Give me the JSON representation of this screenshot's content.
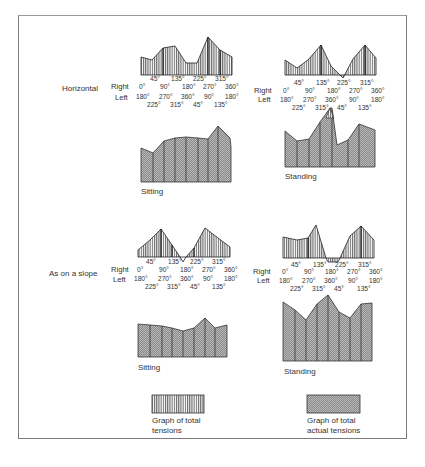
{
  "figure": {
    "rows": [
      {
        "label": "Horizontal",
        "panels": [
          {
            "name": "sitting",
            "caption": "Sitting",
            "right_label": "Right",
            "left_label": "Left",
            "top_ticks": [
              "45°",
              "135°",
              "225°",
              "315°"
            ],
            "right_ticks": [
              "0°",
              "90°",
              "180°",
              "270°",
              "360°"
            ],
            "left_ticks": [
              "180°",
              "270°",
              "360°",
              "90°",
              "180°"
            ],
            "bottom_ticks": [
              "225°",
              "315°",
              "45°",
              "135°"
            ]
          },
          {
            "name": "standing",
            "caption": "Standing",
            "right_label": "Right",
            "left_label": "Left",
            "top_ticks": [
              "45°",
              "135°",
              "225°",
              "315°"
            ],
            "right_ticks": [
              "0°",
              "90°",
              "180°",
              "270°",
              "360°"
            ],
            "left_ticks": [
              "180°",
              "270°",
              "360°",
              "90°",
              "180°"
            ],
            "bottom_ticks": [
              "225°",
              "315°",
              "45°",
              "135°"
            ]
          }
        ]
      },
      {
        "label": "As on a slope",
        "panels": [
          {
            "name": "sitting",
            "caption": "Sitting",
            "right_label": "Right",
            "left_label": "Left",
            "top_ticks": [
              "45°",
              "135°",
              "225°",
              "315°"
            ],
            "right_ticks": [
              "0°",
              "90°",
              "180°",
              "270°",
              "360°"
            ],
            "left_ticks": [
              "180°",
              "270°",
              "360°",
              "90°",
              "180°"
            ],
            "bottom_ticks": [
              "225°",
              "315°",
              "45°",
              "135°"
            ]
          },
          {
            "name": "standing",
            "caption": "Standing",
            "right_label": "Right",
            "left_label": "Left",
            "top_ticks": [
              "45°",
              "135°",
              "225°",
              "315°"
            ],
            "right_ticks": [
              "0°",
              "90°",
              "180°",
              "270°",
              "360°"
            ],
            "left_ticks": [
              "180°",
              "270°",
              "360°",
              "90°",
              "180°"
            ],
            "bottom_ticks": [
              "225°",
              "315°",
              "45°",
              "135°"
            ]
          }
        ]
      }
    ],
    "legend": {
      "total": {
        "line1": "Graph of total",
        "line2": "tensions"
      },
      "actual": {
        "line1": "Graph of total",
        "line2": "actual tensions"
      }
    },
    "colors": {
      "frame": "#7a7a7a",
      "ink": "#222222",
      "hatch_fill": "#bdbdbd"
    }
  }
}
